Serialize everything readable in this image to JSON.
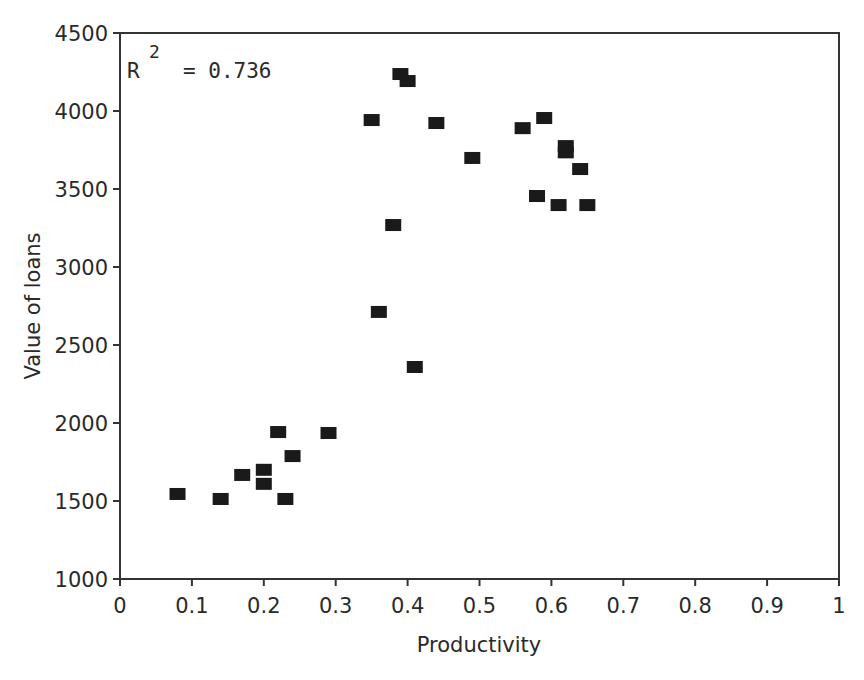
{
  "chart_data": {
    "type": "scatter",
    "title": "",
    "xlabel": "Productivity",
    "ylabel": "Value of loans",
    "xlim": [
      0,
      1
    ],
    "ylim": [
      1000,
      4500
    ],
    "x_ticks": [
      "0",
      "0.1",
      "0.2",
      "0.3",
      "0.4",
      "0.5",
      "0.6",
      "0.7",
      "0.8",
      "0.9",
      "1"
    ],
    "y_ticks": [
      "1000",
      "1500",
      "2000",
      "2500",
      "3000",
      "3500",
      "4000",
      "4500"
    ],
    "grid": false,
    "legend": null,
    "annotation": {
      "r_label": "R",
      "superscript": "2",
      "value_text": "= 0.736"
    },
    "marker": "square",
    "marker_color": "#1a1a1a",
    "series": [
      {
        "name": "loans",
        "points": [
          [
            0.08,
            1545
          ],
          [
            0.14,
            1513
          ],
          [
            0.17,
            1667
          ],
          [
            0.2,
            1700
          ],
          [
            0.2,
            1610
          ],
          [
            0.22,
            1942
          ],
          [
            0.23,
            1513
          ],
          [
            0.24,
            1788
          ],
          [
            0.29,
            1936
          ],
          [
            0.35,
            3942
          ],
          [
            0.36,
            2712
          ],
          [
            0.38,
            3269
          ],
          [
            0.39,
            4237
          ],
          [
            0.4,
            4192
          ],
          [
            0.41,
            2359
          ],
          [
            0.44,
            3923
          ],
          [
            0.49,
            3699
          ],
          [
            0.56,
            3890
          ],
          [
            0.58,
            3455
          ],
          [
            0.59,
            3955
          ],
          [
            0.61,
            3397
          ],
          [
            0.62,
            3775
          ],
          [
            0.62,
            3735
          ],
          [
            0.64,
            3628
          ],
          [
            0.65,
            3397
          ]
        ]
      }
    ]
  }
}
